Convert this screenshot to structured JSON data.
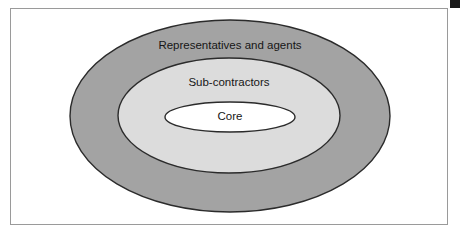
{
  "figure": {
    "type": "concentric-ellipse-diagram",
    "frame": {
      "border_color": "#9a9a9a",
      "background_color": "#ffffff"
    },
    "corner_marker": {
      "name": "black-square-marker",
      "color": "#1a1a1a"
    },
    "rings": [
      {
        "id": "outer",
        "label": "Representatives and agents",
        "fill": "#a3a3a3",
        "stroke": "#2b2b2b",
        "cx": 230,
        "cy": 116,
        "rx": 160,
        "ry": 96,
        "label_x": 230,
        "label_y": 46
      },
      {
        "id": "middle",
        "label": "Sub-contractors",
        "fill": "#dcdcdc",
        "stroke": "#2b2b2b",
        "cx": 229,
        "cy": 115.5,
        "rx": 111,
        "ry": 57.5,
        "label_x": 229,
        "label_y": 83
      },
      {
        "id": "inner",
        "label": "Core",
        "fill": "#ffffff",
        "stroke": "#2b2b2b",
        "cx": 230,
        "cy": 117,
        "rx": 65,
        "ry": 15,
        "label_x": 230,
        "label_y": 117
      }
    ]
  }
}
